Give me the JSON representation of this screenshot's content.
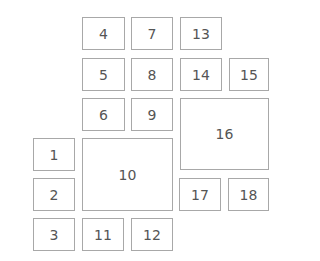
{
  "diagram": {
    "boxes": [
      {
        "id": "1",
        "label": "1",
        "x": 33,
        "y": 138,
        "w": 42,
        "h": 33
      },
      {
        "id": "2",
        "label": "2",
        "x": 33,
        "y": 178,
        "w": 42,
        "h": 33
      },
      {
        "id": "3",
        "label": "3",
        "x": 33,
        "y": 218,
        "w": 42,
        "h": 33
      },
      {
        "id": "4",
        "label": "4",
        "x": 82,
        "y": 17,
        "w": 43,
        "h": 33
      },
      {
        "id": "5",
        "label": "5",
        "x": 82,
        "y": 58,
        "w": 43,
        "h": 33
      },
      {
        "id": "6",
        "label": "6",
        "x": 82,
        "y": 98,
        "w": 43,
        "h": 33
      },
      {
        "id": "7",
        "label": "7",
        "x": 131,
        "y": 17,
        "w": 42,
        "h": 33
      },
      {
        "id": "8",
        "label": "8",
        "x": 131,
        "y": 58,
        "w": 42,
        "h": 33
      },
      {
        "id": "9",
        "label": "9",
        "x": 131,
        "y": 98,
        "w": 42,
        "h": 33
      },
      {
        "id": "10",
        "label": "10",
        "x": 82,
        "y": 138,
        "w": 91,
        "h": 73
      },
      {
        "id": "11",
        "label": "11",
        "x": 82,
        "y": 218,
        "w": 42,
        "h": 33
      },
      {
        "id": "12",
        "label": "12",
        "x": 131,
        "y": 218,
        "w": 42,
        "h": 33
      },
      {
        "id": "13",
        "label": "13",
        "x": 180,
        "y": 17,
        "w": 42,
        "h": 33
      },
      {
        "id": "14",
        "label": "14",
        "x": 180,
        "y": 58,
        "w": 42,
        "h": 33
      },
      {
        "id": "15",
        "label": "15",
        "x": 229,
        "y": 58,
        "w": 40,
        "h": 33
      },
      {
        "id": "16",
        "label": "16",
        "x": 180,
        "y": 98,
        "w": 89,
        "h": 72
      },
      {
        "id": "17",
        "label": "17",
        "x": 179,
        "y": 178,
        "w": 42,
        "h": 33
      },
      {
        "id": "18",
        "label": "18",
        "x": 228,
        "y": 178,
        "w": 41,
        "h": 33
      }
    ]
  }
}
